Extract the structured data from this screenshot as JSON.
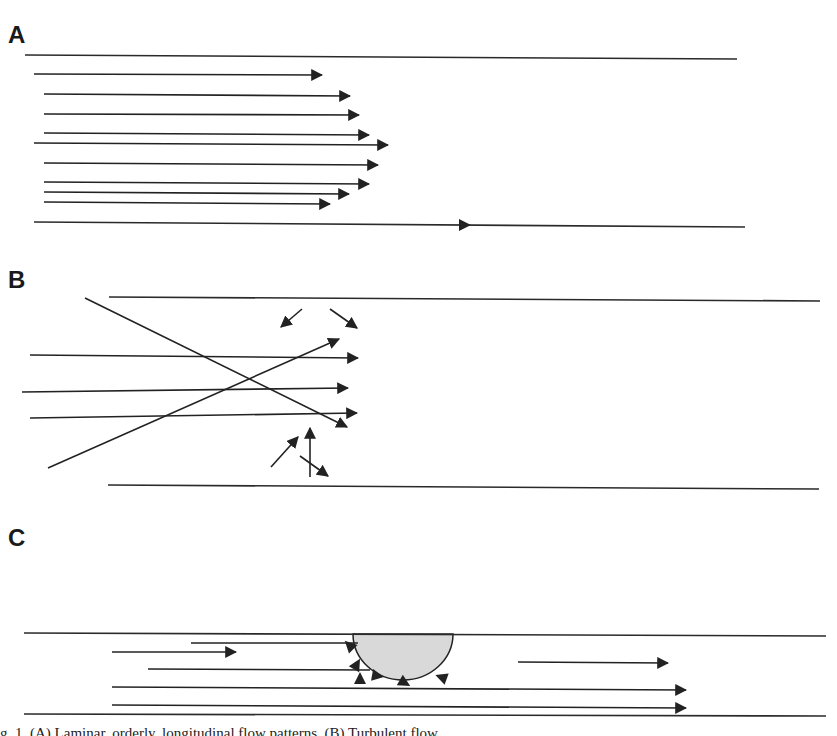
{
  "figure": {
    "colors": {
      "line": "#222222",
      "obstacle_fill": "#d9d9d9",
      "background": "#ffffff"
    },
    "panels": [
      {
        "id": "A",
        "label": "A",
        "description": "Laminar flow — parabolic velocity profile",
        "label_pos": [
          8,
          43
        ],
        "walls": [
          {
            "x1": 25,
            "y1": 55,
            "x2": 737,
            "y2": 59
          },
          {
            "x1": 34,
            "y1": 222,
            "x2": 745,
            "y2": 227
          }
        ],
        "arrows": [
          {
            "x1": 34,
            "y1": 74,
            "x2": 322,
            "y2": 75
          },
          {
            "x1": 44,
            "y1": 94,
            "x2": 350,
            "y2": 96
          },
          {
            "x1": 44,
            "y1": 114,
            "x2": 359,
            "y2": 115
          },
          {
            "x1": 44,
            "y1": 133,
            "x2": 369,
            "y2": 135
          },
          {
            "x1": 34,
            "y1": 143,
            "x2": 388,
            "y2": 145
          },
          {
            "x1": 44,
            "y1": 163,
            "x2": 378,
            "y2": 165
          },
          {
            "x1": 44,
            "y1": 182,
            "x2": 369,
            "y2": 184
          },
          {
            "x1": 44,
            "y1": 192,
            "x2": 349,
            "y2": 194
          },
          {
            "x1": 44,
            "y1": 202,
            "x2": 330,
            "y2": 204
          }
        ],
        "wall_markers": [
          {
            "x": 465,
            "y": 225
          }
        ]
      },
      {
        "id": "B",
        "label": "B",
        "description": "Turbulent flow — chaotic crossing streamlines and eddies",
        "label_pos": [
          8,
          288
        ],
        "walls": [
          {
            "x1": 109,
            "y1": 297,
            "x2": 820,
            "y2": 301
          },
          {
            "x1": 108,
            "y1": 485,
            "x2": 819,
            "y2": 489
          }
        ],
        "arrows": [
          {
            "x1": 30,
            "y1": 355,
            "x2": 358,
            "y2": 358
          },
          {
            "x1": 22,
            "y1": 392,
            "x2": 348,
            "y2": 388
          },
          {
            "x1": 30,
            "y1": 418,
            "x2": 357,
            "y2": 413
          },
          {
            "x1": 85,
            "y1": 298,
            "x2": 347,
            "y2": 427
          },
          {
            "x1": 48,
            "y1": 468,
            "x2": 339,
            "y2": 339
          },
          {
            "x1": 302,
            "y1": 309,
            "x2": 281,
            "y2": 327
          },
          {
            "x1": 330,
            "y1": 309,
            "x2": 357,
            "y2": 328
          },
          {
            "x1": 271,
            "y1": 467,
            "x2": 298,
            "y2": 437
          },
          {
            "x1": 310,
            "y1": 477,
            "x2": 310,
            "y2": 428
          },
          {
            "x1": 300,
            "y1": 456,
            "x2": 328,
            "y2": 476
          }
        ]
      },
      {
        "id": "C",
        "label": "C",
        "description": "Flow disturbance around a wall obstruction with local recirculation",
        "label_pos": [
          8,
          546
        ],
        "walls": [
          {
            "x1": 24,
            "y1": 633,
            "x2": 826,
            "y2": 636
          },
          {
            "x1": 24,
            "y1": 714,
            "x2": 826,
            "y2": 716
          }
        ],
        "obstacle": {
          "cx": 403,
          "cy": 634,
          "rx": 50,
          "ry": 46
        },
        "arrows": [
          {
            "x1": 112,
            "y1": 652,
            "x2": 236,
            "y2": 652
          },
          {
            "x1": 518,
            "y1": 662,
            "x2": 668,
            "y2": 663
          },
          {
            "x1": 112,
            "y1": 687,
            "x2": 686,
            "y2": 690
          },
          {
            "x1": 112,
            "y1": 705,
            "x2": 686,
            "y2": 708
          }
        ],
        "plain_lines": [
          {
            "x1": 191,
            "y1": 643,
            "x2": 358,
            "y2": 643
          },
          {
            "x1": 148,
            "y1": 669,
            "x2": 370,
            "y2": 670
          }
        ],
        "recirculation_heads": [
          {
            "x": 349,
            "y": 645,
            "angle": 225
          },
          {
            "x": 357,
            "y": 664,
            "angle": 300
          },
          {
            "x": 360,
            "y": 678,
            "angle": 270
          },
          {
            "x": 378,
            "y": 676,
            "angle": 10
          },
          {
            "x": 405,
            "y": 683,
            "angle": 30
          },
          {
            "x": 441,
            "y": 677,
            "angle": 200
          }
        ]
      }
    ],
    "caption_fragment": "g. 1. (A) Laminar, orderly, longitudinal flow patterns. (B) Turbulent flow..."
  }
}
